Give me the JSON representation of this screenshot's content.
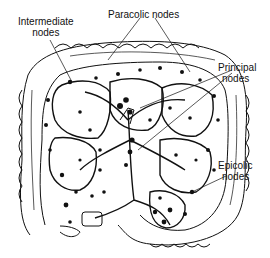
{
  "diagram": {
    "labels": {
      "intermediate": {
        "line1": "Intermediate",
        "line2": "nodes"
      },
      "paracolic": {
        "line1": "Paracolic nodes"
      },
      "principal": {
        "line1": "Principal",
        "line2": "nodes"
      },
      "epicolic": {
        "line1": "Epicolic",
        "line2": "nodes"
      }
    },
    "colors": {
      "ink": "#111111",
      "background": "#ffffff"
    }
  }
}
